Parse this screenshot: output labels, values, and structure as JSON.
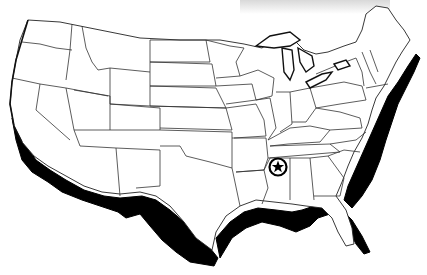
{
  "map": {
    "title": "United States outline map with highlighted coastlines",
    "marker": {
      "icon": "star-in-circle-icon",
      "location_label": "Mississippi"
    },
    "highlight": {
      "description": "Thick black shading along Pacific, Gulf and Atlantic coasts",
      "color": "#000000"
    },
    "colors": {
      "land": "#ffffff",
      "border": "#222222",
      "background": "#ffffff"
    }
  }
}
